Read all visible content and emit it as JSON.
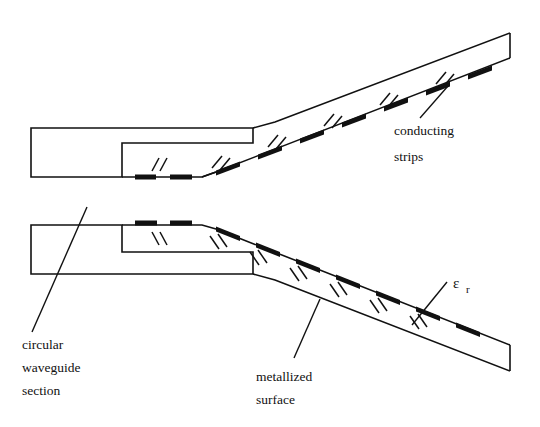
{
  "figure": {
    "background_color": "#ffffff",
    "line_color": "#111111",
    "strip_color": "#111111",
    "width": 540,
    "height": 427
  },
  "labels": {
    "conducting_strips_line1": "conducting",
    "conducting_strips_line2": "strips",
    "circular_waveguide_line1": "circular",
    "circular_waveguide_line2": "waveguide",
    "circular_waveguide_line3": "section",
    "metallized_surface_line1": "metallized",
    "metallized_surface_line2": "surface",
    "epsilon_symbol": "ε",
    "epsilon_subscript": "r"
  },
  "views": [
    {
      "name": "upper-view",
      "description": "Side view: circular waveguide section at left, slab tapers upward to the right, conducting strips on the lower metallized face",
      "strip_face": "bottom",
      "slope_direction": "up-right",
      "strip_count": 9,
      "break_mark_count": 6
    },
    {
      "name": "lower-view",
      "description": "Side view: circular waveguide section at left, slab tapers downward to the right, conducting strips on the upper metallized face",
      "strip_face": "top",
      "slope_direction": "down-right",
      "strip_count": 10,
      "break_mark_count": 7
    }
  ],
  "leaders": [
    {
      "name": "conducting-strips-leader",
      "from": "label",
      "to": "strip-on-upper-slab"
    },
    {
      "name": "circular-waveguide-leader",
      "from": "label",
      "to": "left-rectangle-lower-view"
    },
    {
      "name": "metallized-surface-leader",
      "from": "label",
      "to": "lower-slab-face"
    },
    {
      "name": "epsilon-r-leader",
      "from": "label",
      "to": "dielectric-slab-body"
    }
  ]
}
